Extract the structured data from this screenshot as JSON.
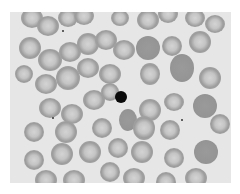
{
  "image": {
    "description": "Grayscale light micrograph of a blood smear showing red blood cells with one dark nucleated cell near the center",
    "colors": {
      "background": "#e6e6e6",
      "cell": "#a9a9a9",
      "nucleus": "#0a0a0a",
      "page": "#ffffff"
    },
    "cells": [
      [
        22,
        6,
        11,
        10
      ],
      [
        38,
        14,
        11,
        10
      ],
      [
        58,
        6,
        10,
        9
      ],
      [
        74,
        4,
        10,
        9
      ],
      [
        110,
        6,
        9,
        8
      ],
      [
        138,
        8,
        11,
        10
      ],
      [
        158,
        2,
        10,
        9
      ],
      [
        185,
        6,
        10,
        9
      ],
      [
        205,
        12,
        10,
        9
      ],
      [
        20,
        36,
        11,
        11
      ],
      [
        40,
        48,
        12,
        11
      ],
      [
        60,
        40,
        11,
        10
      ],
      [
        78,
        32,
        11,
        11
      ],
      [
        96,
        28,
        11,
        10
      ],
      [
        114,
        38,
        11,
        10
      ],
      [
        138,
        36,
        12,
        12,
        "dense"
      ],
      [
        162,
        34,
        10,
        10
      ],
      [
        190,
        30,
        11,
        11
      ],
      [
        14,
        62,
        9,
        9
      ],
      [
        36,
        72,
        11,
        10
      ],
      [
        58,
        66,
        12,
        12
      ],
      [
        78,
        56,
        11,
        10
      ],
      [
        100,
        62,
        11,
        10
      ],
      [
        140,
        62,
        10,
        11
      ],
      [
        172,
        56,
        12,
        14,
        "dense"
      ],
      [
        200,
        66,
        11,
        11
      ],
      [
        40,
        96,
        11,
        10
      ],
      [
        62,
        102,
        11,
        10
      ],
      [
        84,
        88,
        11,
        10
      ],
      [
        100,
        80,
        9,
        9
      ],
      [
        140,
        98,
        11,
        11
      ],
      [
        164,
        90,
        10,
        9
      ],
      [
        195,
        94,
        12,
        12,
        "dense"
      ],
      [
        24,
        120,
        10,
        10
      ],
      [
        56,
        120,
        11,
        11
      ],
      [
        92,
        116,
        10,
        10
      ],
      [
        118,
        108,
        9,
        11,
        "dense"
      ],
      [
        134,
        116,
        11,
        12
      ],
      [
        160,
        118,
        10,
        10
      ],
      [
        210,
        112,
        10,
        10
      ],
      [
        24,
        148,
        10,
        10
      ],
      [
        52,
        142,
        11,
        11
      ],
      [
        80,
        140,
        11,
        11
      ],
      [
        108,
        136,
        10,
        10
      ],
      [
        132,
        140,
        11,
        11
      ],
      [
        164,
        146,
        10,
        10
      ],
      [
        196,
        140,
        12,
        12,
        "dense"
      ],
      [
        36,
        168,
        11,
        10
      ],
      [
        64,
        168,
        11,
        10
      ],
      [
        100,
        160,
        10,
        10
      ],
      [
        124,
        166,
        11,
        10
      ],
      [
        156,
        170,
        10,
        10
      ],
      [
        186,
        166,
        11,
        10
      ]
    ],
    "nucleus": {
      "x": 121,
      "y": 97,
      "r": 6
    },
    "specks": [
      [
        42,
        105
      ],
      [
        171,
        107
      ],
      [
        52,
        18
      ]
    ]
  }
}
